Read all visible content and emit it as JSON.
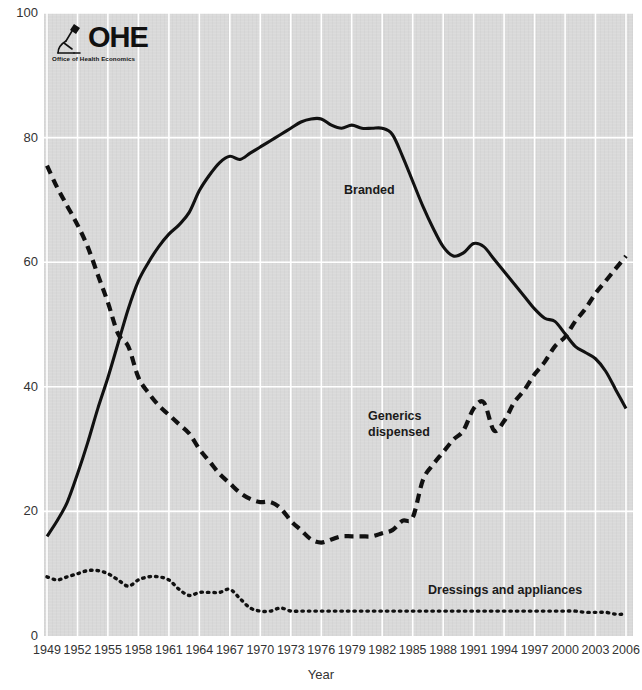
{
  "logo": {
    "name": "OHE",
    "wordmark": "OHE",
    "subtitle": "Office of Health Economics",
    "icon": "microscope-icon"
  },
  "axes": {
    "x_title": "Year",
    "y_ticks": [
      "0",
      "20",
      "40",
      "60",
      "80",
      "100"
    ],
    "x_ticks": [
      "1949",
      "1952",
      "1955",
      "1958",
      "1961",
      "1964",
      "1967",
      "1970",
      "1973",
      "1976",
      "1979",
      "1982",
      "1985",
      "1988",
      "1991",
      "1994",
      "1997",
      "2000",
      "2003",
      "2006"
    ]
  },
  "annotations": {
    "branded": "Branded",
    "generics_line1": "Generics",
    "generics_line2": "dispensed",
    "dressings": "Dressings and appliances"
  },
  "colors": {
    "plot_background": "#d9d9d9",
    "gridline": "#ffffff",
    "series": "#111111",
    "page_background": "#ffffff",
    "text": "#333333"
  },
  "chart_data": {
    "type": "line",
    "title": "",
    "subtitle": "",
    "xlabel": "Year",
    "ylabel": "",
    "xlim": [
      1949,
      2006
    ],
    "ylim": [
      0,
      100
    ],
    "grid": true,
    "grid_axis": "x",
    "legend": "inline-annotations",
    "x": [
      1949,
      1950,
      1951,
      1952,
      1953,
      1954,
      1955,
      1956,
      1957,
      1958,
      1959,
      1960,
      1961,
      1962,
      1963,
      1964,
      1965,
      1966,
      1967,
      1968,
      1969,
      1970,
      1971,
      1972,
      1973,
      1974,
      1975,
      1976,
      1977,
      1978,
      1979,
      1980,
      1981,
      1982,
      1983,
      1984,
      1985,
      1986,
      1987,
      1988,
      1989,
      1990,
      1991,
      1992,
      1993,
      1994,
      1995,
      1996,
      1997,
      1998,
      1999,
      2000,
      2001,
      2002,
      2003,
      2004,
      2005,
      2006
    ],
    "series": [
      {
        "name": "Branded",
        "style": "solid",
        "values": [
          16.0,
          18.5,
          21.5,
          26.0,
          31.0,
          36.5,
          41.5,
          47.0,
          52.5,
          57.0,
          60.0,
          62.5,
          64.5,
          66.0,
          68.0,
          71.5,
          74.0,
          76.0,
          77.0,
          76.5,
          77.5,
          78.5,
          79.5,
          80.5,
          81.5,
          82.5,
          83.0,
          83.0,
          82.0,
          81.5,
          82.0,
          81.5,
          81.5,
          81.5,
          80.5,
          77.0,
          73.0,
          69.0,
          65.5,
          62.5,
          61.0,
          61.5,
          63.0,
          62.5,
          60.5,
          58.5,
          56.5,
          54.5,
          52.5,
          51.0,
          50.5,
          48.5,
          46.5,
          45.5,
          44.5,
          42.5,
          39.5,
          36.5
        ]
      },
      {
        "name": "Generics dispensed",
        "style": "dashed",
        "values": [
          75.5,
          72.0,
          69.0,
          66.0,
          62.5,
          58.0,
          53.5,
          48.5,
          46.5,
          41.5,
          39.0,
          37.0,
          35.5,
          34.0,
          32.5,
          30.0,
          28.0,
          26.0,
          24.5,
          23.0,
          22.0,
          21.5,
          21.5,
          20.5,
          18.5,
          17.0,
          15.5,
          15.0,
          15.5,
          16.0,
          16.0,
          16.0,
          16.0,
          16.5,
          17.0,
          18.5,
          19.0,
          25.0,
          27.5,
          29.5,
          31.5,
          33.0,
          36.5,
          37.5,
          33.0,
          34.5,
          37.5,
          39.5,
          42.0,
          44.0,
          46.5,
          48.0,
          50.5,
          52.5,
          55.0,
          57.0,
          59.0,
          61.0
        ]
      },
      {
        "name": "Dressings and appliances",
        "style": "dotted",
        "values": [
          9.5,
          9.0,
          9.5,
          10.0,
          10.5,
          10.5,
          10.0,
          9.0,
          8.0,
          9.0,
          9.5,
          9.5,
          9.0,
          7.5,
          6.5,
          7.0,
          7.0,
          7.0,
          7.5,
          6.0,
          4.5,
          4.0,
          4.0,
          4.5,
          4.0,
          4.0,
          4.0,
          4.0,
          4.0,
          4.0,
          4.0,
          4.0,
          4.0,
          4.0,
          4.0,
          4.0,
          4.0,
          4.0,
          4.0,
          4.0,
          4.0,
          4.0,
          4.0,
          4.0,
          4.0,
          4.0,
          4.0,
          4.0,
          4.0,
          4.0,
          4.0,
          4.0,
          4.0,
          3.8,
          3.8,
          3.8,
          3.5,
          3.5
        ]
      }
    ]
  }
}
